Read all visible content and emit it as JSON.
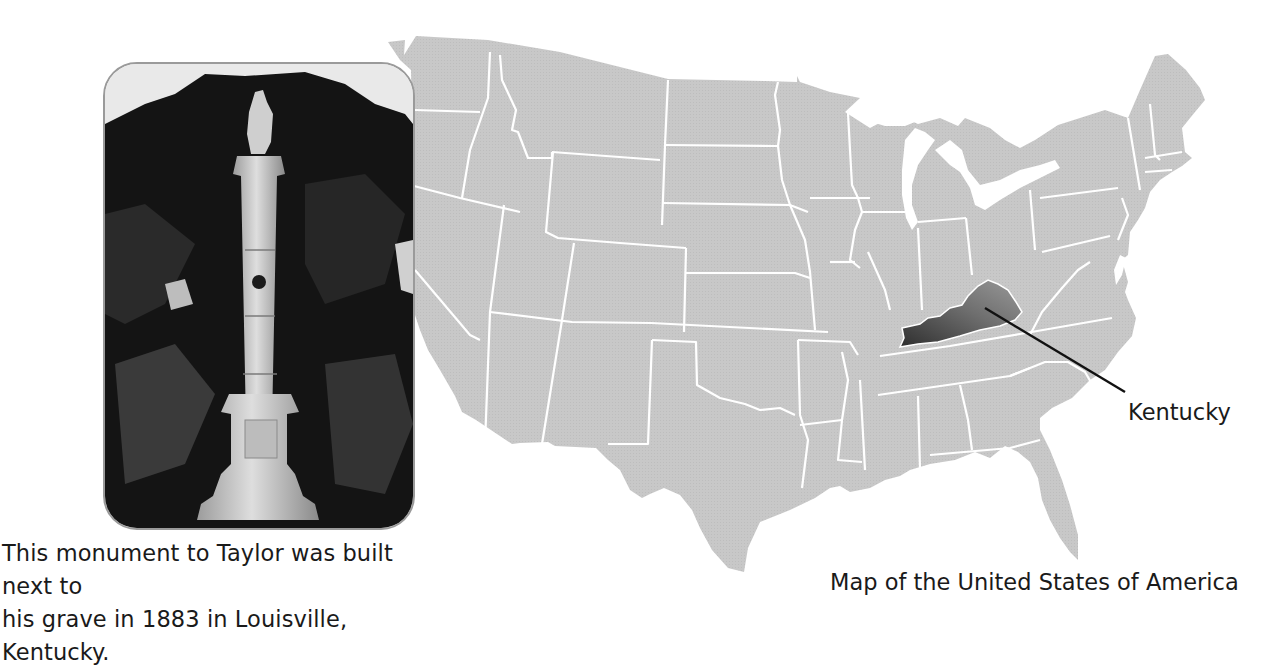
{
  "photo": {
    "subject": "Monument to Zachary Taylor",
    "caption_line1": "This monument to Taylor was built next to",
    "caption_line2": "his grave in 1883 in Louisville, Kentucky."
  },
  "map": {
    "title": "Map of the United States of America",
    "highlighted_state": "Kentucky",
    "highlight_label": "Kentucky",
    "colors": {
      "land": "#c6c6c6",
      "border": "#ffffff",
      "highlight_dark": "#3a3a3a",
      "highlight_light": "#8a8a8a",
      "leader_line": "#111111"
    }
  }
}
